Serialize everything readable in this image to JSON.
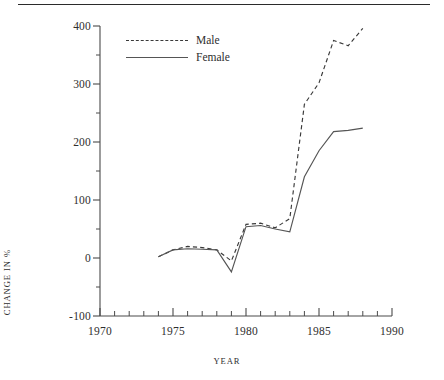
{
  "figure": {
    "top_rule": true,
    "background_color": "#ffffff",
    "line_color_male": "#3a3a3a",
    "line_color_female": "#555555",
    "axis_color": "#4a4a4a"
  },
  "legend": {
    "position": "inside-top-left",
    "entries": [
      {
        "label": "Male",
        "style": "dashed",
        "key_name": "dashed-line-key"
      },
      {
        "label": "Female",
        "style": "solid",
        "key_name": "solid-line-key"
      }
    ]
  },
  "axes": {
    "x_title": "YEAR",
    "y_title": "CHANGE IN %",
    "x_tick_labels": [
      "1970",
      "1975",
      "1980",
      "1985",
      "1990"
    ],
    "y_tick_labels": [
      "400",
      "300",
      "200",
      "100",
      "0",
      "-100"
    ]
  },
  "chart_data": {
    "type": "line",
    "title": "",
    "subtitle": "",
    "xlabel": "YEAR",
    "ylabel": "CHANGE IN %",
    "xlim": [
      1970,
      1990
    ],
    "ylim": [
      -100,
      400
    ],
    "x_major_ticks": [
      1970,
      1975,
      1980,
      1985,
      1990
    ],
    "x_minor_tick_interval": 1,
    "y_major_ticks": [
      -100,
      0,
      100,
      200,
      300,
      400
    ],
    "y_minor_ticks": [
      -50,
      50,
      150,
      250,
      350
    ],
    "grid": false,
    "legend_position": "upper left inside",
    "series": [
      {
        "name": "Male",
        "style": "dashed",
        "color": "#3a3a3a",
        "x": [
          1974,
          1975,
          1976,
          1977,
          1978,
          1979,
          1980,
          1981,
          1982,
          1983,
          1984,
          1985,
          1986,
          1987,
          1988
        ],
        "values": [
          2,
          14,
          20,
          18,
          14,
          -5,
          58,
          60,
          52,
          68,
          265,
          302,
          375,
          366,
          396
        ]
      },
      {
        "name": "Female",
        "style": "solid",
        "color": "#555555",
        "x": [
          1974,
          1975,
          1976,
          1977,
          1978,
          1979,
          1980,
          1981,
          1982,
          1983,
          1984,
          1985,
          1986,
          1987,
          1988
        ],
        "values": [
          2,
          14,
          16,
          15,
          14,
          -24,
          54,
          56,
          50,
          45,
          140,
          185,
          218,
          220,
          224
        ]
      }
    ],
    "annotations": []
  }
}
